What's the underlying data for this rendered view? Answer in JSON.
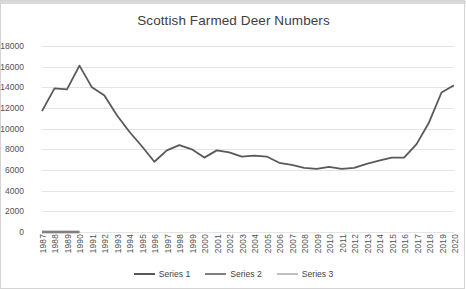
{
  "chart_data": {
    "type": "line",
    "title": "Scottish Farmed Deer Numbers",
    "xlabel": "",
    "ylabel": "",
    "ylim": [
      0,
      18000
    ],
    "ytick_step": 2000,
    "yticks": [
      "18000",
      "16000",
      "14000",
      "12000",
      "10000",
      "8000",
      "6000",
      "4000",
      "2000",
      "0"
    ],
    "grid": true,
    "legend_position": "bottom",
    "categories": [
      "1987",
      "1988",
      "1989",
      "1990",
      "1991",
      "1992",
      "1993",
      "1994",
      "1995",
      "1996",
      "1997",
      "1998",
      "1999",
      "2000",
      "2001",
      "2002",
      "2003",
      "2004",
      "2005",
      "2006",
      "2007",
      "2008",
      "2009",
      "2010",
      "2011",
      "2012",
      "2013",
      "2014",
      "2015",
      "2016",
      "2017",
      "2018",
      "2019",
      "2020"
    ],
    "series": [
      {
        "name": "Series 1",
        "color": "#595959",
        "values": [
          11700,
          13900,
          13800,
          16100,
          14000,
          13200,
          11300,
          9700,
          8300,
          6800,
          7900,
          8400,
          8000,
          7200,
          7900,
          7700,
          7300,
          7400,
          7300,
          6700,
          6500,
          6200,
          6100,
          6300,
          6100,
          6200,
          6600,
          6900,
          7200,
          7200,
          8500,
          10600,
          13500,
          14200
        ]
      },
      {
        "name": "Series 2",
        "color": "#808080",
        "values": [
          0,
          0,
          0,
          0,
          null,
          null,
          null,
          null,
          null,
          null,
          null,
          null,
          null,
          null,
          null,
          null,
          null,
          null,
          null,
          null,
          null,
          null,
          null,
          null,
          null,
          null,
          null,
          null,
          null,
          null,
          null,
          null,
          null,
          null
        ]
      },
      {
        "name": "Series 3",
        "color": "#bfbfbf",
        "values": [
          0,
          0,
          0,
          0,
          null,
          null,
          null,
          null,
          null,
          null,
          null,
          null,
          null,
          null,
          null,
          null,
          null,
          null,
          null,
          null,
          null,
          null,
          null,
          null,
          null,
          null,
          null,
          null,
          null,
          null,
          null,
          null,
          null,
          null
        ]
      }
    ]
  },
  "legend": {
    "items": [
      {
        "label": "Series 1"
      },
      {
        "label": "Series 2"
      },
      {
        "label": "Series 3"
      }
    ]
  }
}
